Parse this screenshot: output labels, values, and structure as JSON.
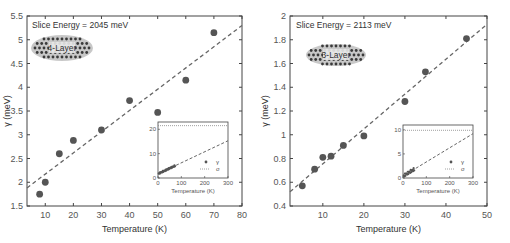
{
  "chart_data": [
    {
      "type": "scatter",
      "title": "",
      "annotation": "Slice Energy = 2045 meV",
      "illustration_label": "4-Layer",
      "xlabel": "Temperature (K)",
      "ylabel": "γ (meV)",
      "xlim": [
        3.5,
        80
      ],
      "ylim": [
        1.5,
        5.5
      ],
      "xticks": [
        10,
        20,
        30,
        40,
        50,
        60,
        70,
        80
      ],
      "yticks": [
        1.5,
        2,
        2.5,
        3,
        3.5,
        4,
        4.5,
        5,
        5.5
      ],
      "grid": false,
      "series": [
        {
          "name": "γ",
          "style": "markers",
          "x": [
            8,
            10,
            15,
            20,
            30,
            40,
            50,
            60,
            70
          ],
          "y": [
            1.75,
            2.0,
            2.6,
            2.88,
            3.1,
            3.72,
            3.47,
            4.15,
            5.15
          ]
        },
        {
          "name": "linear fit",
          "style": "dashed",
          "x": [
            3.5,
            80
          ],
          "y": [
            1.88,
            5.3
          ]
        }
      ],
      "inset": {
        "xlabel": "Temperature (K)",
        "xlim": [
          0,
          300
        ],
        "ylim": [
          0,
          23
        ],
        "xticks": [
          0,
          100,
          200,
          300
        ],
        "yticks": [
          0,
          10,
          20
        ],
        "legend": [
          "γ",
          "σ"
        ],
        "sigma_level": 21.5,
        "fit_line": {
          "x": [
            0,
            300
          ],
          "y": [
            1.7,
            15.3
          ]
        }
      }
    },
    {
      "type": "scatter",
      "title": "",
      "annotation": "Slice Energy = 2113 meV",
      "illustration_label": "3-Layer",
      "xlabel": "Temperature (K)",
      "ylabel": "γ (meV)",
      "xlim": [
        2,
        50
      ],
      "ylim": [
        0.4,
        2.0
      ],
      "xticks": [
        10,
        20,
        30,
        40,
        50
      ],
      "yticks": [
        0.4,
        0.6,
        0.8,
        1.0,
        1.2,
        1.4,
        1.6,
        1.8,
        2.0
      ],
      "grid": false,
      "series": [
        {
          "name": "γ",
          "style": "markers",
          "x": [
            5,
            8,
            10,
            12,
            15,
            20,
            30,
            35,
            45
          ],
          "y": [
            0.57,
            0.71,
            0.81,
            0.82,
            0.91,
            0.99,
            1.28,
            1.53,
            1.81
          ]
        },
        {
          "name": "linear fit",
          "style": "dashed",
          "x": [
            2,
            50
          ],
          "y": [
            0.52,
            1.93
          ]
        }
      ],
      "inset": {
        "xlabel": "Temperature (K)",
        "xlim": [
          0,
          300
        ],
        "ylim": [
          0,
          11
        ],
        "xticks": [
          0,
          100,
          200,
          300
        ],
        "yticks": [
          0,
          5,
          10
        ],
        "legend": [
          "γ",
          "σ"
        ],
        "sigma_level": 9.9,
        "fit_line": {
          "x": [
            0,
            300
          ],
          "y": [
            0.4,
            9.2
          ]
        }
      }
    }
  ],
  "labels": {
    "left_annotation": "Slice Energy = 2045 meV",
    "left_badge": "4-Layer",
    "right_annotation": "Slice Energy = 2113 meV",
    "right_badge": "3-Layer",
    "xlabel": "Temperature (K)",
    "ylabel": "γ (meV)",
    "inset_xlabel": "Temperature (K)",
    "legend_gamma": "γ",
    "legend_sigma": "σ"
  }
}
